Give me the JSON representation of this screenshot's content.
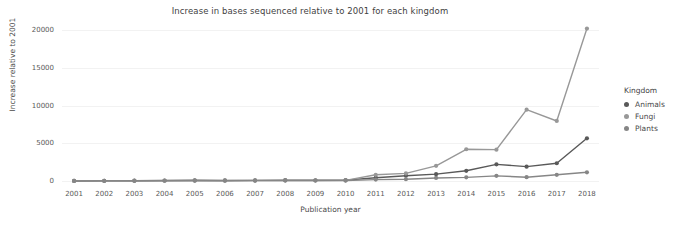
{
  "chart_data": {
    "type": "line",
    "title": "Increase in bases sequenced relative to 2001 for each kingdom",
    "xlabel": "Publication year",
    "ylabel": "Increase relative to 2001",
    "x": [
      2001,
      2002,
      2003,
      2004,
      2005,
      2006,
      2007,
      2008,
      2009,
      2010,
      2011,
      2012,
      2013,
      2014,
      2015,
      2016,
      2017,
      2018
    ],
    "xtick_labels": [
      "2001",
      "2002",
      "2003",
      "2004",
      "2005",
      "2006",
      "2007",
      "2008",
      "2009",
      "2010",
      "2011",
      "2012",
      "2013",
      "2014",
      "2015",
      "2016",
      "2017",
      "2018"
    ],
    "ytick_labels": [
      "0",
      "5000",
      "10000",
      "15000",
      "20000"
    ],
    "yticks": [
      0,
      5000,
      10000,
      15000,
      20000
    ],
    "ylim": [
      -800,
      20800
    ],
    "xlim": [
      2000.6,
      2018.4
    ],
    "grid": true,
    "legend_position": "right",
    "legend_title": "Kingdom",
    "markers": "circle",
    "series": [
      {
        "name": "Animals",
        "color": "#595959",
        "values": [
          0,
          20,
          35,
          60,
          90,
          70,
          80,
          110,
          95,
          110,
          430,
          700,
          900,
          1350,
          2200,
          1900,
          2350,
          5650
        ]
      },
      {
        "name": "Fungi",
        "color": "#989898",
        "values": [
          0,
          15,
          25,
          40,
          50,
          45,
          55,
          70,
          60,
          75,
          820,
          1000,
          2000,
          4200,
          4150,
          9450,
          7950,
          20200
        ]
      },
      {
        "name": "Plants",
        "color": "#868686",
        "values": [
          0,
          10,
          20,
          30,
          35,
          30,
          40,
          50,
          45,
          55,
          180,
          230,
          400,
          480,
          680,
          500,
          820,
          1150
        ]
      }
    ]
  },
  "legend": {
    "title": "Kingdom",
    "items": [
      {
        "label": "Animals",
        "color": "#595959"
      },
      {
        "label": "Fungi",
        "color": "#989898"
      },
      {
        "label": "Plants",
        "color": "#868686"
      }
    ]
  }
}
